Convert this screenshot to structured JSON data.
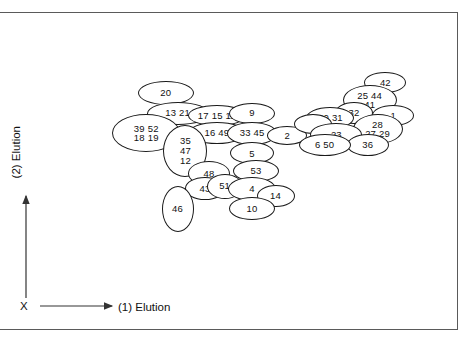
{
  "figure": {
    "axes": {
      "x_label": "(1) Elution",
      "y_label": "(2) Elution",
      "origin_label": "X"
    }
  },
  "chart_data": {
    "type": "scatter",
    "title": "",
    "xlabel": "(1) Elution",
    "ylabel": "(2) Elution",
    "grid": false,
    "legend": "none",
    "axis_style": "arrows from origin marked X, no tick marks, no numeric scale",
    "spot_count": 38,
    "spots": [
      {
        "id": "spot-20",
        "labels": [
          "20"
        ],
        "x": 0.27,
        "y": 0.79,
        "w": 56,
        "h": 24
      },
      {
        "id": "spot-13-21",
        "labels": [
          "13 21"
        ],
        "x": 0.3,
        "y": 0.71,
        "w": 62,
        "h": 23
      },
      {
        "id": "spot-17-15-11",
        "labels": [
          "17 15 11"
        ],
        "x": 0.4,
        "y": 0.7,
        "w": 58,
        "h": 21
      },
      {
        "id": "spot-9",
        "labels": [
          "9"
        ],
        "x": 0.49,
        "y": 0.71,
        "w": 46,
        "h": 21
      },
      {
        "id": "spot-39-52-18-19",
        "labels": [
          "39  52",
          "18  19"
        ],
        "x": 0.22,
        "y": 0.63,
        "w": 68,
        "h": 38
      },
      {
        "id": "spot-16-49",
        "labels": [
          "16  49"
        ],
        "x": 0.4,
        "y": 0.63,
        "w": 58,
        "h": 22
      },
      {
        "id": "spot-33-45",
        "labels": [
          "33 45"
        ],
        "x": 0.49,
        "y": 0.63,
        "w": 50,
        "h": 23
      },
      {
        "id": "spot-2",
        "labels": [
          "2"
        ],
        "x": 0.58,
        "y": 0.62,
        "w": 40,
        "h": 19
      },
      {
        "id": "spot-35-47-12",
        "labels": [
          "35",
          "47",
          "12"
        ],
        "x": 0.32,
        "y": 0.56,
        "w": 44,
        "h": 52
      },
      {
        "id": "spot-5",
        "labels": [
          "5"
        ],
        "x": 0.49,
        "y": 0.55,
        "w": 44,
        "h": 22
      },
      {
        "id": "spot-53",
        "labels": [
          "53"
        ],
        "x": 0.5,
        "y": 0.48,
        "w": 46,
        "h": 22
      },
      {
        "id": "spot-48",
        "labels": [
          "48"
        ],
        "x": 0.38,
        "y": 0.47,
        "w": 42,
        "h": 25
      },
      {
        "id": "spot-43",
        "labels": [
          "43"
        ],
        "x": 0.37,
        "y": 0.41,
        "w": 40,
        "h": 23
      },
      {
        "id": "spot-51",
        "labels": [
          "51"
        ],
        "x": 0.42,
        "y": 0.42,
        "w": 36,
        "h": 25
      },
      {
        "id": "spot-4",
        "labels": [
          "4"
        ],
        "x": 0.49,
        "y": 0.41,
        "w": 48,
        "h": 24
      },
      {
        "id": "spot-14",
        "labels": [
          "14"
        ],
        "x": 0.55,
        "y": 0.38,
        "w": 38,
        "h": 22
      },
      {
        "id": "spot-10",
        "labels": [
          "10"
        ],
        "x": 0.49,
        "y": 0.33,
        "w": 46,
        "h": 23
      },
      {
        "id": "spot-46",
        "labels": [
          "46"
        ],
        "x": 0.3,
        "y": 0.33,
        "w": 32,
        "h": 46
      },
      {
        "id": "spot-42",
        "labels": [
          "42"
        ],
        "x": 0.83,
        "y": 0.83,
        "w": 42,
        "h": 21
      },
      {
        "id": "spot-25-44-41",
        "labels": [
          "25 44",
          "41"
        ],
        "x": 0.79,
        "y": 0.76,
        "w": 54,
        "h": 30
      },
      {
        "id": "spot-32",
        "labels": [
          "32"
        ],
        "x": 0.75,
        "y": 0.71,
        "w": 38,
        "h": 22
      },
      {
        "id": "spot-1",
        "labels": [
          "1"
        ],
        "x": 0.85,
        "y": 0.7,
        "w": 42,
        "h": 21
      },
      {
        "id": "spot-30-31",
        "labels": [
          "30 31"
        ],
        "x": 0.69,
        "y": 0.69,
        "w": 48,
        "h": 22
      },
      {
        "id": "spot-blank-left",
        "labels": [],
        "x": 0.645,
        "y": 0.665,
        "w": 38,
        "h": 20
      },
      {
        "id": "spot-28-27-29",
        "labels": [
          "28",
          "27 29"
        ],
        "x": 0.81,
        "y": 0.645,
        "w": 50,
        "h": 30
      },
      {
        "id": "spot-23",
        "labels": [
          "23"
        ],
        "x": 0.705,
        "y": 0.625,
        "w": 52,
        "h": 23
      },
      {
        "id": "spot-36",
        "labels": [
          "36"
        ],
        "x": 0.785,
        "y": 0.585,
        "w": 42,
        "h": 22
      },
      {
        "id": "spot-6-50",
        "labels": [
          "6  50"
        ],
        "x": 0.675,
        "y": 0.585,
        "w": 52,
        "h": 22
      }
    ]
  }
}
